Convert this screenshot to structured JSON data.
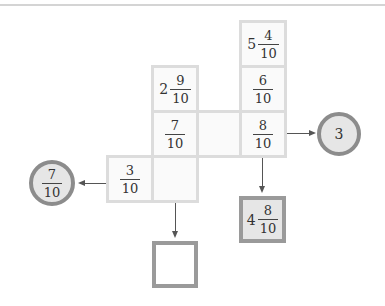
{
  "grid": {
    "cells": [
      {
        "id": "r0c3",
        "whole": "5",
        "num": "4",
        "den": "10"
      },
      {
        "id": "r1c1",
        "whole": "2",
        "num": "9",
        "den": "10"
      },
      {
        "id": "r1c3",
        "whole": "",
        "num": "6",
        "den": "10"
      },
      {
        "id": "r2c1",
        "whole": "",
        "num": "7",
        "den": "10"
      },
      {
        "id": "r2c2",
        "whole": "",
        "num": "",
        "den": ""
      },
      {
        "id": "r2c3",
        "whole": "",
        "num": "8",
        "den": "10"
      },
      {
        "id": "r3c0",
        "whole": "",
        "num": "3",
        "den": "10"
      },
      {
        "id": "r3c1",
        "whole": "",
        "num": "",
        "den": ""
      }
    ]
  },
  "outputs": {
    "right_circle": {
      "value": "3"
    },
    "left_circle": {
      "num": "7",
      "den": "10"
    },
    "bottom_right_box": {
      "whole": "4",
      "num": "8",
      "den": "10"
    },
    "bottom_box": {
      "value": ""
    }
  },
  "colors": {
    "cell_border": "#dcdcdc",
    "answer_border": "#9a9a9a",
    "circle_fill": "#e6e6e6",
    "arrow": "#555555"
  }
}
